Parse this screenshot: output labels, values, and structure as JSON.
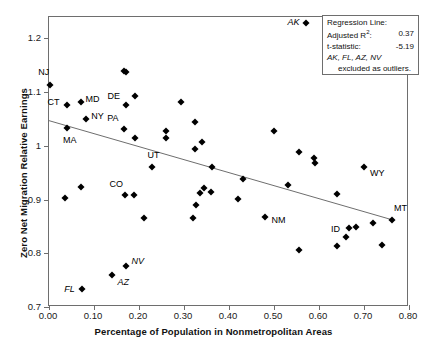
{
  "chart_data": {
    "type": "scatter",
    "title": "",
    "xlabel": "Percentage of Population in Nonmetropolitan Areas",
    "ylabel": "Zero Net Migration Relative Earnings",
    "xlim": [
      0.0,
      0.8
    ],
    "ylim": [
      0.7,
      1.24
    ],
    "xticks": [
      "0.00",
      "0.10",
      "0.20",
      "0.30",
      "0.40",
      "0.50",
      "0.60",
      "0.70",
      "0.80"
    ],
    "xtick_values": [
      0.0,
      0.1,
      0.2,
      0.3,
      0.4,
      0.5,
      0.6,
      0.7,
      0.8
    ],
    "yticks": [
      "0.7",
      "0.8",
      "0.9",
      "1",
      "1.1",
      "1.2"
    ],
    "ytick_values": [
      0.7,
      0.8,
      0.9,
      1.0,
      1.1,
      1.2
    ],
    "grid": false,
    "legend_position": "top-right",
    "marker": "filled-diamond",
    "marker_color": "#000000",
    "line_color": "#6e6e6e",
    "points": [
      {
        "x": 0.003,
        "y": 1.114,
        "label": "NJ",
        "label_dx": -12,
        "label_dy": -12,
        "italic": false
      },
      {
        "x": 0.041,
        "y": 1.076,
        "label": "CT",
        "label_dx": -20,
        "label_dy": -2,
        "italic": false
      },
      {
        "x": 0.07,
        "y": 1.081,
        "label": "MD",
        "label_dx": 5,
        "label_dy": -2,
        "italic": false
      },
      {
        "x": 0.083,
        "y": 1.051,
        "label": "NY",
        "label_dx": 5,
        "label_dy": -2,
        "italic": false
      },
      {
        "x": 0.04,
        "y": 1.033,
        "label": "MA",
        "label_dx": -4,
        "label_dy": 13,
        "italic": false
      },
      {
        "x": 0.167,
        "y": 1.14,
        "label": null
      },
      {
        "x": 0.172,
        "y": 1.137,
        "label": null
      },
      {
        "x": 0.17,
        "y": 1.077,
        "label": "DE",
        "label_dx": -18,
        "label_dy": -8,
        "italic": false
      },
      {
        "x": 0.19,
        "y": 1.093,
        "label": null
      },
      {
        "x": 0.167,
        "y": 1.031,
        "label": "PA",
        "label_dx": -17,
        "label_dy": -10,
        "italic": false
      },
      {
        "x": 0.19,
        "y": 1.014,
        "label": null
      },
      {
        "x": 0.228,
        "y": 0.96,
        "label": "UT",
        "label_dx": -4,
        "label_dy": -11,
        "italic": false
      },
      {
        "x": 0.259,
        "y": 1.028,
        "label": null
      },
      {
        "x": 0.26,
        "y": 1.014,
        "label": null
      },
      {
        "x": 0.293,
        "y": 1.081,
        "label": null
      },
      {
        "x": 0.325,
        "y": 1.045,
        "label": null
      },
      {
        "x": 0.324,
        "y": 0.995,
        "label": null
      },
      {
        "x": 0.341,
        "y": 1.007,
        "label": null
      },
      {
        "x": 0.362,
        "y": 0.96,
        "label": null
      },
      {
        "x": 0.43,
        "y": 0.938,
        "label": null
      },
      {
        "x": 0.499,
        "y": 1.027,
        "label": null
      },
      {
        "x": 0.53,
        "y": 0.928,
        "label": null
      },
      {
        "x": 0.556,
        "y": 0.988,
        "label": null
      },
      {
        "x": 0.589,
        "y": 0.977,
        "label": null
      },
      {
        "x": 0.591,
        "y": 0.969,
        "label": null
      },
      {
        "x": 0.7,
        "y": 0.96,
        "label": "WY",
        "label_dx": 6,
        "label_dy": 7,
        "italic": false
      },
      {
        "x": 0.036,
        "y": 0.903,
        "label": null
      },
      {
        "x": 0.07,
        "y": 0.923,
        "label": null
      },
      {
        "x": 0.168,
        "y": 0.909,
        "label": "CO",
        "label_dx": -15,
        "label_dy": -10,
        "italic": false
      },
      {
        "x": 0.188,
        "y": 0.908,
        "label": null
      },
      {
        "x": 0.211,
        "y": 0.866,
        "label": null
      },
      {
        "x": 0.32,
        "y": 0.866,
        "label": null
      },
      {
        "x": 0.326,
        "y": 0.89,
        "label": null
      },
      {
        "x": 0.335,
        "y": 0.913,
        "label": null
      },
      {
        "x": 0.344,
        "y": 0.921,
        "label": null
      },
      {
        "x": 0.361,
        "y": 0.914,
        "label": null
      },
      {
        "x": 0.419,
        "y": 0.902,
        "label": null
      },
      {
        "x": 0.481,
        "y": 0.867,
        "label": "NM",
        "label_dx": 6,
        "label_dy": 4,
        "italic": false
      },
      {
        "x": 0.555,
        "y": 0.806,
        "label": null
      },
      {
        "x": 0.641,
        "y": 0.91,
        "label": null
      },
      {
        "x": 0.641,
        "y": 0.814,
        "label": null
      },
      {
        "x": 0.66,
        "y": 0.831,
        "label": "ID",
        "label_dx": -15,
        "label_dy": -7,
        "italic": false
      },
      {
        "x": 0.667,
        "y": 0.848,
        "label": null
      },
      {
        "x": 0.683,
        "y": 0.849,
        "label": null
      },
      {
        "x": 0.721,
        "y": 0.856,
        "label": null
      },
      {
        "x": 0.741,
        "y": 0.816,
        "label": null
      },
      {
        "x": 0.762,
        "y": 0.862,
        "label": "MT",
        "label_dx": 2,
        "label_dy": -11,
        "italic": false
      },
      {
        "x": 0.17,
        "y": 0.777,
        "label": "NV",
        "label_dx": 6,
        "label_dy": -4,
        "italic": true
      },
      {
        "x": 0.141,
        "y": 0.759,
        "label": "AZ",
        "label_dx": 5,
        "label_dy": 8,
        "italic": true
      },
      {
        "x": 0.074,
        "y": 0.734,
        "label": "FL",
        "label_dx": -18,
        "label_dy": 1,
        "italic": true
      }
    ],
    "outlier_annotation": {
      "label": "AK",
      "x": 0.57,
      "y": 1.228
    },
    "regression_line": {
      "x1": 0.0,
      "y1": 1.047,
      "x2": 0.76,
      "y2": 0.863
    }
  },
  "legend": {
    "title": "Regression Line:",
    "rows": [
      {
        "label": "Adjusted R²:",
        "value": "0.37"
      },
      {
        "label": "t-statistic:",
        "value": "-5.19"
      }
    ],
    "outliers_line1": "AK, FL, AZ, NV",
    "outliers_line2": "excluded as outliers."
  }
}
